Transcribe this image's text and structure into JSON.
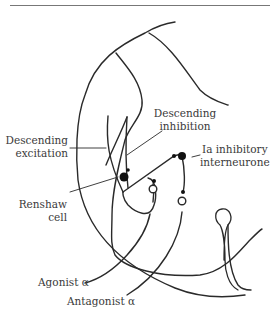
{
  "labels": {
    "descending_excitation": [
      "Descending",
      "excitation"
    ],
    "descending_inhibition": [
      "Descending",
      "inhibition"
    ],
    "ia_interneurone": [
      "Ia inhibitory",
      "interneurone"
    ],
    "renshaw": [
      "Renshaw",
      "cell"
    ],
    "agonist": "Agonist α",
    "antagonist": "Antagonist α"
  },
  "colors": {
    "line": "#2a2a2a",
    "text": "#3a3a3a"
  }
}
